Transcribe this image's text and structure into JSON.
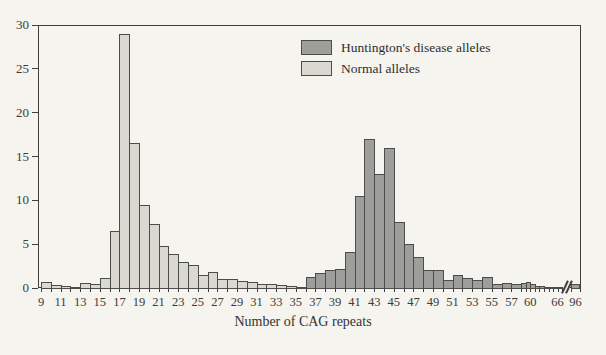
{
  "figure": {
    "xlabel": "Number of CAG repeats",
    "legend": [
      {
        "label": "Huntington's disease alleles",
        "color": "#9e9e9a"
      },
      {
        "label": "Normal alleles",
        "color": "#d9d8d1"
      }
    ],
    "colors": {
      "paper": "#f5f4ef",
      "normal_fill": "#d9d8d1",
      "disease_fill": "#9e9e9a",
      "line": "#3f3f3f",
      "text": "#333333"
    }
  },
  "chart_data": {
    "type": "bar",
    "subtype": "histogram",
    "title": "",
    "xlabel": "Number of CAG repeats",
    "ylabel": "",
    "ylim": [
      0,
      30
    ],
    "y_ticks": [
      0,
      5,
      10,
      15,
      20,
      25,
      30
    ],
    "x_tick_labels": [
      "9",
      "11",
      "13",
      "15",
      "17",
      "19",
      "21",
      "23",
      "25",
      "27",
      "29",
      "31",
      "33",
      "35",
      "37",
      "39",
      "41",
      "43",
      "45",
      "47",
      "49",
      "51",
      "53",
      "55",
      "57",
      "60",
      "66",
      "96"
    ],
    "x_axis_break_before_96": true,
    "grid": false,
    "legend_position": "upper-center",
    "series": [
      {
        "name": "Normal alleles",
        "color": "#d9d8d1",
        "points": [
          [
            9,
            0.7
          ],
          [
            10,
            0.35
          ],
          [
            11,
            0.2
          ],
          [
            12,
            0.1
          ],
          [
            13,
            0.6
          ],
          [
            14,
            0.4
          ],
          [
            15,
            1.1
          ],
          [
            16,
            6.5
          ],
          [
            17,
            29
          ],
          [
            18,
            16.5
          ],
          [
            19,
            9.5
          ],
          [
            20,
            7.3
          ],
          [
            21,
            4.8
          ],
          [
            22,
            3.9
          ],
          [
            23,
            3.0
          ],
          [
            24,
            2.6
          ],
          [
            25,
            1.5
          ],
          [
            26,
            1.8
          ],
          [
            27,
            1.0
          ],
          [
            28,
            1.0
          ],
          [
            29,
            0.8
          ],
          [
            30,
            0.65
          ],
          [
            31,
            0.5
          ],
          [
            32,
            0.45
          ],
          [
            33,
            0.3
          ],
          [
            34,
            0.25
          ],
          [
            35,
            0.15
          ]
        ]
      },
      {
        "name": "Huntington's disease alleles",
        "color": "#9e9e9a",
        "points": [
          [
            36,
            1.2
          ],
          [
            37,
            1.7
          ],
          [
            38,
            2.0
          ],
          [
            39,
            2.2
          ],
          [
            40,
            4.1
          ],
          [
            41,
            10.5
          ],
          [
            42,
            17
          ],
          [
            43,
            13
          ],
          [
            44,
            16
          ],
          [
            45,
            7.5
          ],
          [
            46,
            5.0
          ],
          [
            47,
            3.5
          ],
          [
            48,
            2.0
          ],
          [
            49,
            2.0
          ],
          [
            50,
            0.9
          ],
          [
            51,
            1.5
          ],
          [
            52,
            1.1
          ],
          [
            53,
            0.9
          ],
          [
            54,
            1.2
          ],
          [
            55,
            0.5
          ],
          [
            56,
            0.6
          ],
          [
            57,
            0.4
          ],
          [
            58,
            0.6
          ],
          [
            59,
            0.7
          ],
          [
            60,
            0.5
          ],
          [
            61,
            0.2
          ],
          [
            62,
            0.2
          ],
          [
            63,
            0.15
          ],
          [
            64,
            0.15
          ],
          [
            65,
            0.15
          ],
          [
            66,
            0.15
          ],
          [
            96,
            0.4
          ]
        ]
      }
    ]
  }
}
